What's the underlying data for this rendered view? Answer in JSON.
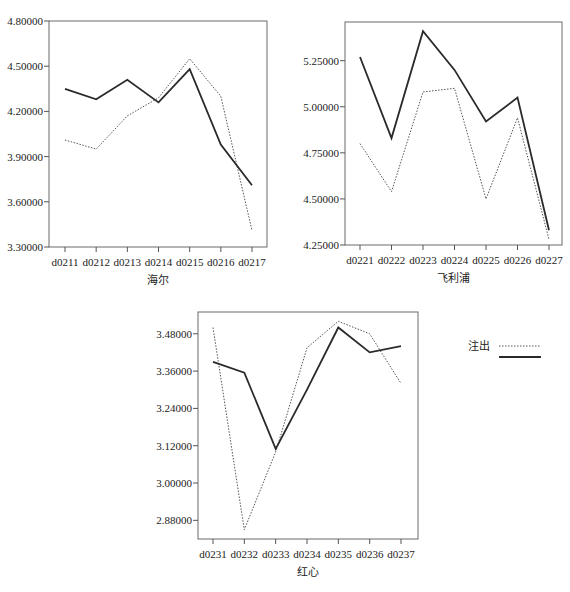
{
  "legend": {
    "label": "注出",
    "entries": [
      {
        "style": "dotted",
        "label": "注出"
      },
      {
        "style": "solid",
        "label": ""
      }
    ]
  },
  "chart_data": [
    {
      "type": "line",
      "title": "",
      "xlabel": "海尔",
      "ylabel": "",
      "categories": [
        "d0211",
        "d0212",
        "d0213",
        "d0214",
        "d0215",
        "d0216",
        "d0217"
      ],
      "yticks": [
        "3.30000",
        "3.60000",
        "3.90000",
        "4.20000",
        "4.50000",
        "4.80000"
      ],
      "ylim": [
        3.3,
        4.8
      ],
      "grid": false,
      "series": [
        {
          "name": "solid",
          "style": "solid",
          "values": [
            4.35,
            4.28,
            4.41,
            4.26,
            4.48,
            3.98,
            3.71
          ]
        },
        {
          "name": "注出",
          "style": "dotted",
          "values": [
            4.01,
            3.95,
            4.17,
            4.29,
            4.55,
            4.3,
            3.41
          ]
        }
      ],
      "box": {
        "x0": 49,
        "y0": 21,
        "x1": 267,
        "y1": 247,
        "xfirst": 65,
        "xlast": 252
      }
    },
    {
      "type": "line",
      "title": "",
      "xlabel": "飞利浦",
      "ylabel": "",
      "categories": [
        "d0221",
        "d0222",
        "d0223",
        "d0224",
        "d0225",
        "d0226",
        "d0227"
      ],
      "yticks": [
        "4.25000",
        "4.50000",
        "4.75000",
        "5.00000",
        "5.25000"
      ],
      "ylim": [
        4.25,
        5.46
      ],
      "grid": false,
      "series": [
        {
          "name": "solid",
          "style": "solid",
          "values": [
            5.27,
            4.83,
            5.41,
            5.2,
            4.92,
            5.05,
            4.33
          ]
        },
        {
          "name": "注出",
          "style": "dotted",
          "values": [
            4.8,
            4.54,
            5.08,
            5.1,
            4.5,
            4.94,
            4.28
          ]
        }
      ],
      "box": {
        "x0": 345,
        "y0": 22,
        "x1": 562,
        "y1": 245,
        "xfirst": 360,
        "xlast": 549
      }
    },
    {
      "type": "line",
      "title": "",
      "xlabel": "红心",
      "ylabel": "",
      "categories": [
        "d0231",
        "d0232",
        "d0233",
        "d0234",
        "d0235",
        "d0236",
        "d0237"
      ],
      "yticks": [
        "2.88000",
        "3.00000",
        "3.12000",
        "3.24000",
        "3.36000",
        "3.48000"
      ],
      "ylim": [
        2.82,
        3.55
      ],
      "grid": false,
      "series": [
        {
          "name": "solid",
          "style": "solid",
          "values": [
            3.39,
            3.355,
            3.11,
            3.3,
            3.5,
            3.42,
            3.44
          ]
        },
        {
          "name": "注出",
          "style": "dotted",
          "values": [
            3.5,
            2.85,
            3.1,
            3.435,
            3.52,
            3.48,
            3.32
          ]
        }
      ],
      "box": {
        "x0": 198,
        "y0": 312,
        "x1": 418,
        "y1": 539,
        "xfirst": 213,
        "xlast": 401
      }
    }
  ]
}
